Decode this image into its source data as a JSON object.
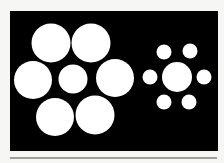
{
  "figure": {
    "name": "Ebbinghaus illusion",
    "background": "#000000",
    "circle_color": "#ffffff",
    "panel": {
      "x": 10,
      "y": 11,
      "width": 208,
      "height": 140
    },
    "rule": {
      "x1": 10,
      "x2": 217,
      "y": 158,
      "color": "#444444"
    },
    "left_cluster": {
      "center": {
        "cx": 73,
        "cy": 79,
        "r": 14.5
      },
      "surround": [
        {
          "cx": 51,
          "cy": 43,
          "r": 19.5
        },
        {
          "cx": 91,
          "cy": 43,
          "r": 19.5
        },
        {
          "cx": 33,
          "cy": 80,
          "r": 19
        },
        {
          "cx": 115,
          "cy": 78,
          "r": 19
        },
        {
          "cx": 55,
          "cy": 117,
          "r": 19
        },
        {
          "cx": 95,
          "cy": 115,
          "r": 19.5
        }
      ]
    },
    "right_cluster": {
      "center": {
        "cx": 177,
        "cy": 77,
        "r": 15
      },
      "surround": [
        {
          "cx": 164,
          "cy": 52,
          "r": 7.5
        },
        {
          "cx": 190,
          "cy": 51,
          "r": 7.5
        },
        {
          "cx": 150,
          "cy": 77,
          "r": 7.5
        },
        {
          "cx": 204,
          "cy": 77,
          "r": 7.5
        },
        {
          "cx": 164,
          "cy": 102,
          "r": 7.5
        },
        {
          "cx": 189,
          "cy": 102,
          "r": 7.5
        }
      ]
    }
  }
}
